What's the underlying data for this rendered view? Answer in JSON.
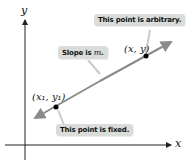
{
  "diagram": {
    "axes": {
      "x_label": "x",
      "y_label": "y"
    },
    "points": [
      {
        "label": "(x₁, y₁)",
        "description": "fixed point"
      },
      {
        "label": "(x, y)",
        "description": "arbitrary point"
      }
    ],
    "callouts": {
      "arbitrary": "This point is arbitrary.",
      "slope_prefix": "Slope is ",
      "slope_var": "m",
      "slope_suffix": ".",
      "fixed": "This point is fixed."
    },
    "colors": {
      "line": "#8a8a8a",
      "callout_bg": "#d9dcd9",
      "axis": "#222222"
    }
  }
}
